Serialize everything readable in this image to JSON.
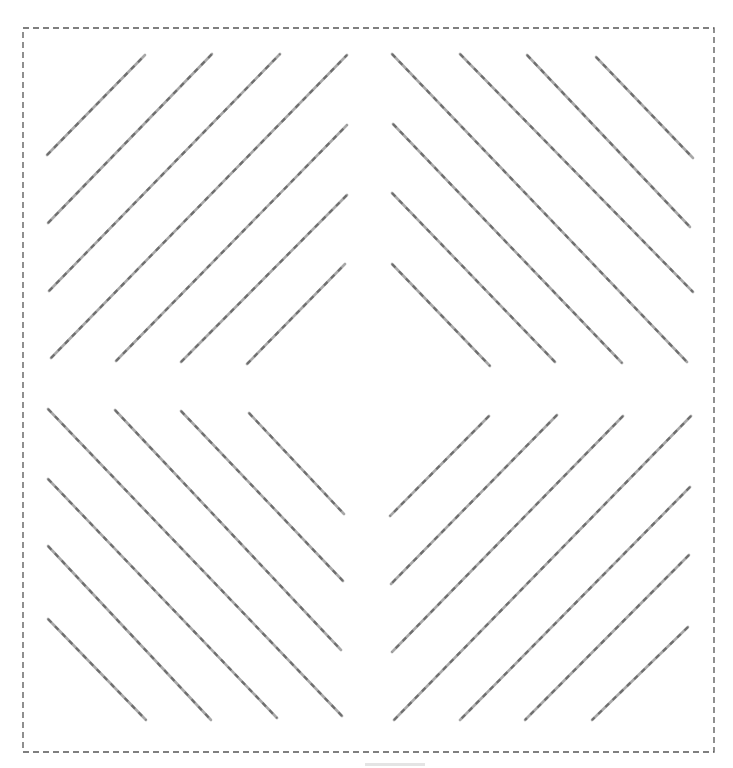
{
  "figure": {
    "frame": {
      "x": 23,
      "y": 28,
      "width": 691,
      "height": 724,
      "style": "dashed",
      "color": "#555555"
    },
    "line_style": {
      "base_color": "#a8a8a8",
      "dash_color": "#6e6e6e",
      "pattern": "dashed"
    },
    "groups": [
      {
        "name": "top-left",
        "orientation": "ascending",
        "lines": [
          [
            47,
            155,
            145,
            55
          ],
          [
            48,
            223,
            212,
            54
          ],
          [
            49,
            291,
            280,
            54
          ],
          [
            51,
            358,
            347,
            55
          ],
          [
            116,
            361,
            347,
            125
          ],
          [
            181,
            362,
            347,
            195
          ],
          [
            247,
            364,
            345,
            264
          ]
        ]
      },
      {
        "name": "top-right",
        "orientation": "descending",
        "lines": [
          [
            392,
            54,
            687,
            362
          ],
          [
            460,
            54,
            693,
            292
          ],
          [
            527,
            55,
            690,
            227
          ],
          [
            596,
            57,
            693,
            158
          ],
          [
            393,
            124,
            622,
            363
          ],
          [
            392,
            193,
            555,
            362
          ],
          [
            392,
            264,
            490,
            366
          ]
        ]
      },
      {
        "name": "bottom-left",
        "orientation": "descending",
        "lines": [
          [
            48,
            409,
            342,
            716
          ],
          [
            115,
            410,
            341,
            650
          ],
          [
            181,
            411,
            343,
            581
          ],
          [
            249,
            413,
            344,
            514
          ],
          [
            48,
            479,
            277,
            718
          ],
          [
            48,
            546,
            211,
            720
          ],
          [
            48,
            619,
            146,
            720
          ]
        ]
      },
      {
        "name": "bottom-right",
        "orientation": "ascending",
        "lines": [
          [
            489,
            416,
            390,
            516
          ],
          [
            557,
            415,
            391,
            584
          ],
          [
            623,
            416,
            392,
            652
          ],
          [
            691,
            416,
            394,
            720
          ],
          [
            690,
            487,
            460,
            720
          ],
          [
            689,
            555,
            525,
            720
          ],
          [
            688,
            627,
            592,
            720
          ]
        ]
      }
    ]
  }
}
